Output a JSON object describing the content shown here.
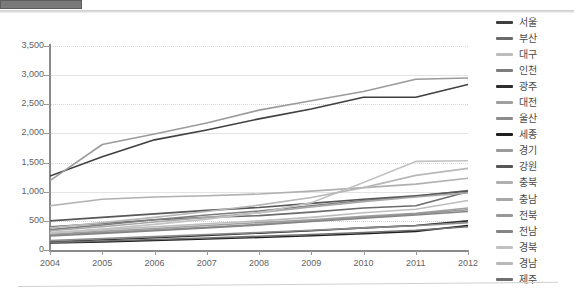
{
  "chart_data": {
    "type": "line",
    "title": "",
    "xlabel": "",
    "ylabel": "",
    "x": [
      2004,
      2005,
      2006,
      2007,
      2008,
      2009,
      2010,
      2011,
      2012
    ],
    "xtick_labels": [
      "2004",
      "2005",
      "2006",
      "2007",
      "2008",
      "2009",
      "2010",
      "2011",
      "2012"
    ],
    "ytick_labels": [
      "0",
      "500",
      "1,000",
      "1,500",
      "2,000",
      "2,500",
      "3,000",
      "3,500"
    ],
    "ytick_values": [
      0,
      500,
      1000,
      1500,
      2000,
      2500,
      3000,
      3500
    ],
    "ylim": [
      0,
      3500
    ],
    "xlim": [
      2004,
      2012
    ],
    "grid": true,
    "legend_position": "right",
    "series": [
      {
        "name": "서울",
        "color": "#3f3f3f",
        "values": [
          1270,
          1600,
          1890,
          2060,
          2250,
          2420,
          2620,
          2620,
          2840
        ]
      },
      {
        "name": "부산",
        "color": "#6b6b6b",
        "values": [
          400,
          455,
          520,
          560,
          590,
          650,
          720,
          760,
          1000
        ]
      },
      {
        "name": "대구",
        "color": "#bdbdbd",
        "values": [
          300,
          350,
          400,
          450,
          500,
          560,
          640,
          700,
          850
        ]
      },
      {
        "name": "인천",
        "color": "#7d7d7d",
        "values": [
          350,
          430,
          520,
          600,
          670,
          760,
          850,
          920,
          1020
        ]
      },
      {
        "name": "광주",
        "color": "#2e2e2e",
        "values": [
          140,
          175,
          210,
          250,
          290,
          330,
          380,
          420,
          500
        ]
      },
      {
        "name": "대전",
        "color": "#a0a0a0",
        "values": [
          270,
          320,
          370,
          420,
          470,
          520,
          580,
          630,
          720
        ]
      },
      {
        "name": "울산",
        "color": "#8c8c8c",
        "values": [
          160,
          195,
          230,
          265,
          300,
          340,
          380,
          415,
          470
        ]
      },
      {
        "name": "세종",
        "color": "#1f1f1f",
        "values": [
          120,
          140,
          165,
          190,
          215,
          245,
          280,
          320,
          420
        ]
      },
      {
        "name": "경기",
        "color": "#9b9b9b",
        "values": [
          1190,
          1810,
          1990,
          2180,
          2400,
          2560,
          2720,
          2930,
          2950
        ]
      },
      {
        "name": "강원",
        "color": "#575757",
        "values": [
          500,
          560,
          620,
          680,
          730,
          800,
          870,
          930,
          1010
        ]
      },
      {
        "name": "충북",
        "color": "#b0b0b0",
        "values": [
          760,
          870,
          910,
          930,
          960,
          1010,
          1070,
          1130,
          1230
        ]
      },
      {
        "name": "충남",
        "color": "#a8a8a8",
        "values": [
          330,
          400,
          480,
          560,
          640,
          740,
          830,
          910,
          980
        ]
      },
      {
        "name": "전북",
        "color": "#989898",
        "values": [
          260,
          300,
          345,
          390,
          440,
          500,
          560,
          620,
          690
        ]
      },
      {
        "name": "전남",
        "color": "#858585",
        "values": [
          240,
          285,
          330,
          380,
          430,
          490,
          545,
          600,
          660
        ]
      },
      {
        "name": "경북",
        "color": "#c2c2c2",
        "values": [
          290,
          360,
          440,
          530,
          640,
          810,
          1160,
          1520,
          1530
        ]
      },
      {
        "name": "경남",
        "color": "#b8b8b8",
        "values": [
          380,
          470,
          560,
          660,
          770,
          900,
          1070,
          1280,
          1400
        ]
      },
      {
        "name": "제주",
        "color": "#6f6f6f",
        "values": [
          130,
          155,
          180,
          205,
          235,
          265,
          300,
          340,
          400
        ]
      }
    ]
  },
  "theme": {
    "axis_color": "#8a8a8a",
    "grid_color": "#e4e4e4",
    "text_color": "#5f5f5f",
    "background": "#ffffff"
  }
}
